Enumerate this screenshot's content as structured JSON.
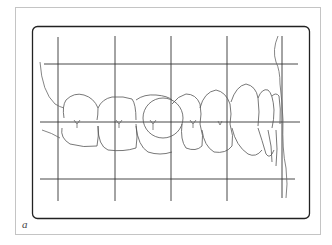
{
  "figure": {
    "panel_label": "a",
    "colors": {
      "background": "#ffffff",
      "outer_frame": "#bdbdbd",
      "inner_frame": "#222222",
      "grid": "#333333",
      "teeth_outline": "#555555"
    },
    "grid": {
      "vertical_lines": 5,
      "horizontal_lines": 3
    }
  }
}
